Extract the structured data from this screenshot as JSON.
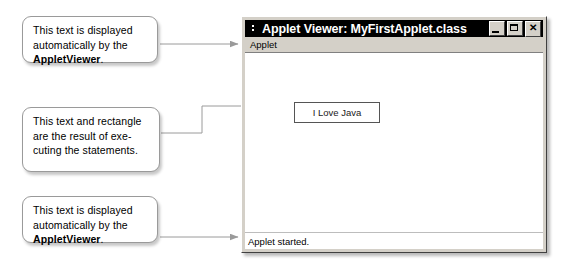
{
  "callouts": [
    {
      "id": "callout-1",
      "lines": [
        "This text is displayed",
        "automatically by the"
      ],
      "bold_text": "AppletViewer",
      "trailing": "."
    },
    {
      "id": "callout-2",
      "lines": [
        "This text and rectangle",
        "are the result of exe-",
        "cuting the statements."
      ],
      "bold_text": "",
      "trailing": ""
    },
    {
      "id": "callout-3",
      "lines": [
        "This text is displayed",
        "automatically by the"
      ],
      "bold_text": "AppletViewer",
      "trailing": "."
    }
  ],
  "window": {
    "title": "Applet Viewer: MyFirstApplet.class",
    "title_icon": "applet-window-icon",
    "buttons": {
      "minimize": "_",
      "maximize": "□",
      "close": "✕"
    },
    "menu": {
      "applet": "Applet"
    },
    "canvas": {
      "box_label": "I Love Java"
    },
    "status": {
      "text": "Applet started."
    }
  },
  "colors": {
    "titlebar_bg": "#000000",
    "titlebar_text": "#ffffff",
    "window_face": "#d4d0c8",
    "canvas_bg": "#ffffff",
    "connector_line": "#9a9a9a",
    "callout_border": "#9a9a9a"
  }
}
